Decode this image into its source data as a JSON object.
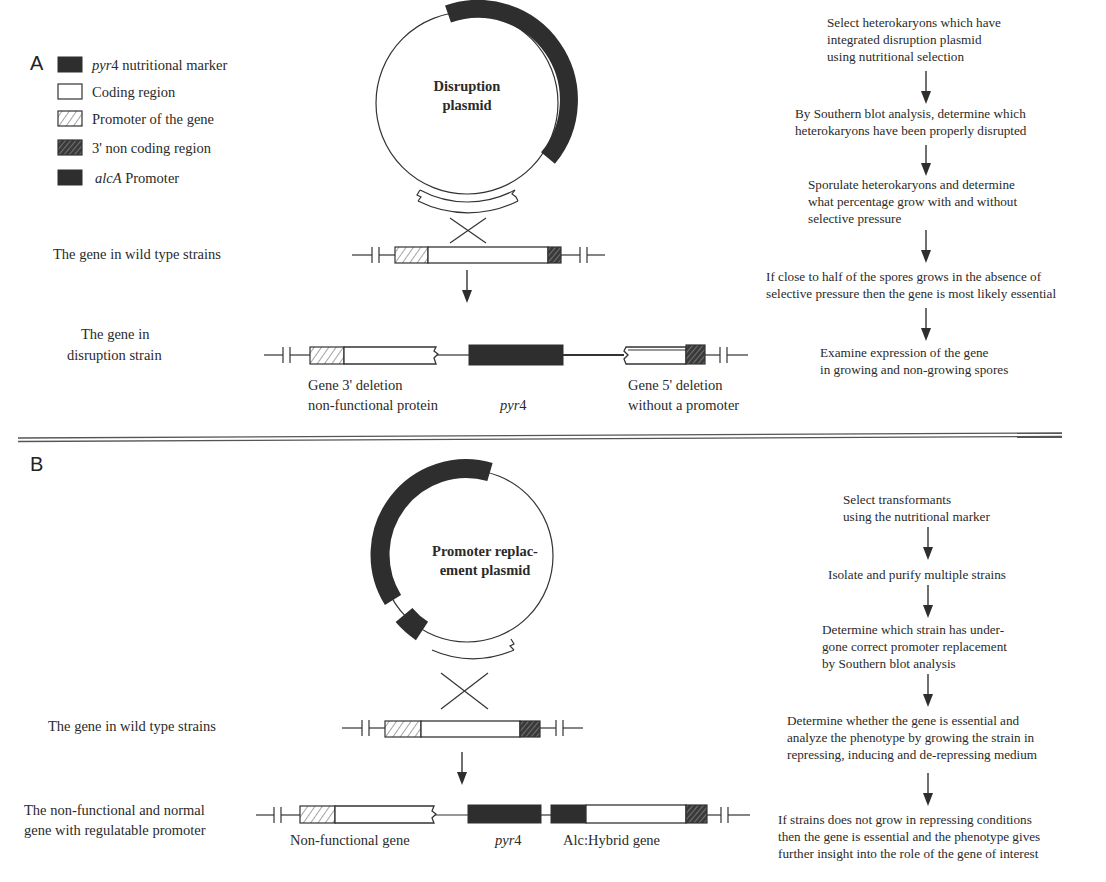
{
  "panels": {
    "a": {
      "label": "A",
      "legend": [
        {
          "key": "pyr4",
          "italic": "pyr",
          "text": "4 nutritional marker",
          "swatch": "dark"
        },
        {
          "key": "coding",
          "italic": "",
          "text": "Coding region",
          "swatch": "white"
        },
        {
          "key": "promoter",
          "italic": "",
          "text": "Promoter of the gene",
          "swatch": "light-hatch"
        },
        {
          "key": "noncoding",
          "italic": "",
          "text": "3' non coding region",
          "swatch": "dark-hatch"
        },
        {
          "key": "alca",
          "italic": "alcA",
          "text": " Promoter",
          "swatch": "dark"
        }
      ],
      "plasmid_title_line1": "Disruption",
      "plasmid_title_line2": "plasmid",
      "wild_type_label": "The gene in wild type strains",
      "result_label_line1": "The gene in",
      "result_label_line2": "disruption strain",
      "fragment_labels": {
        "left_line1": "Gene 3' deletion",
        "left_line2": "non-functional protein",
        "middle_italic": "pyr",
        "middle_rest": "4",
        "right_line1": "Gene 5' deletion",
        "right_line2": "without a promoter"
      },
      "steps": [
        [
          "Select heterokaryons which have",
          "integrated disruption plasmid",
          "using nutritional selection"
        ],
        [
          "By Southern blot analysis, determine which",
          "heterokaryons have been properly disrupted"
        ],
        [
          "Sporulate heterokaryons and determine",
          "what percentage grow with and without",
          "selective pressure"
        ],
        [
          "If close to half of the spores grows in the absence of",
          "selective pressure then the gene is most likely essential"
        ],
        [
          "Examine expression of the gene",
          "in growing and non-growing spores"
        ]
      ]
    },
    "b": {
      "label": "B",
      "plasmid_title_line1": "Promoter replac-",
      "plasmid_title_line2": "ement plasmid",
      "wild_type_label": "The gene in wild type strains",
      "result_label_line1": "The non-functional and normal",
      "result_label_line2": "gene with regulatable promoter",
      "fragment_labels": {
        "left": "Non-functional gene",
        "middle_italic": "pyr",
        "middle_rest": "4",
        "right": "Alc:Hybrid gene"
      },
      "steps": [
        [
          "Select transformants",
          "using the nutritional marker"
        ],
        [
          "Isolate and purify multiple strains"
        ],
        [
          "Determine which strain has under-",
          "gone correct promoter replacement",
          "by Southern blot analysis"
        ],
        [
          "Determine whether the gene is essential and",
          "analyze the phenotype by growing the strain in",
          "repressing, inducing and de-repressing medium"
        ],
        [
          "If strains does not grow in repressing conditions",
          "then the gene is essential and the phenotype gives",
          "further insight into the role of the gene of interest"
        ]
      ]
    }
  }
}
